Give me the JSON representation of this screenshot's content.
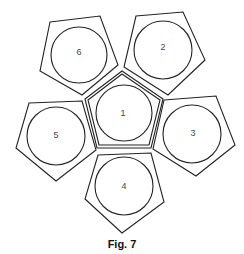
{
  "figure": {
    "caption": "Fig. 7",
    "line_color": "#222222",
    "label_color": "#444444"
  },
  "cells": [
    {
      "id": "1",
      "label": "1",
      "position": "center"
    },
    {
      "id": "2",
      "label": "2",
      "position": "top-right"
    },
    {
      "id": "3",
      "label": "3",
      "position": "right"
    },
    {
      "id": "4",
      "label": "4",
      "position": "bottom"
    },
    {
      "id": "5",
      "label": "5",
      "position": "left"
    },
    {
      "id": "6",
      "label": "6",
      "position": "top-left"
    }
  ]
}
